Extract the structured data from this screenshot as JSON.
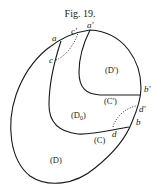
{
  "figure": {
    "title": "Fig. 19.",
    "points": {
      "a": "a",
      "a_prime": "a'",
      "c": "c",
      "c_prime": "c'",
      "b": "b",
      "b_prime": "b'",
      "d": "d",
      "d_prime": "d'"
    },
    "regions": {
      "D_prime": "(D')",
      "C_prime": "(C')",
      "D0": "(D",
      "D0_sub": "0",
      "D0_close": ")",
      "C": "(C)",
      "D": "(D)"
    },
    "colors": {
      "ink": "#1a1a1a",
      "background": "#ffffff"
    }
  }
}
